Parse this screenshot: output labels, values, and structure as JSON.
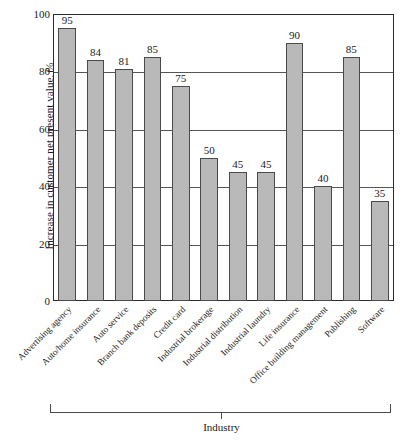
{
  "chart_data": {
    "type": "bar",
    "title": "",
    "xlabel": "Industry",
    "ylabel": "Increase in customer net present value, %",
    "ylim": [
      0,
      100
    ],
    "yticks": [
      0,
      20,
      40,
      60,
      80,
      100
    ],
    "grid": "horizontal",
    "legend": "none",
    "categories": [
      "Advertising agency",
      "Auto/home insurance",
      "Auto service",
      "Branch bank deposits",
      "Credit card",
      "Industrial brokerage",
      "Industrial distribution",
      "Industrial laundry",
      "Life insurance",
      "Office building management",
      "Publishing",
      "Software"
    ],
    "values": [
      95,
      84,
      81,
      85,
      75,
      50,
      45,
      45,
      90,
      40,
      85,
      35
    ],
    "bar_color": "#b9b9b9",
    "bar_edge_color": "#4a4a4a",
    "axis_color": "#2a2a2a"
  }
}
